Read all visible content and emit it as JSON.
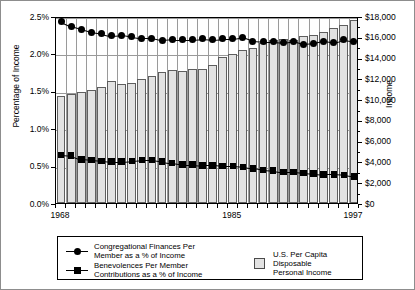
{
  "chart_data": {
    "type": "bar",
    "title": "",
    "subtitle": "",
    "xlabel": "",
    "ylabel": "Percentage of Income",
    "ylabel_right": "Income",
    "grid": true,
    "legend_position": "bottom",
    "x": [
      1968,
      1969,
      1970,
      1971,
      1972,
      1973,
      1974,
      1975,
      1976,
      1977,
      1978,
      1979,
      1980,
      1981,
      1982,
      1983,
      1984,
      1985,
      1986,
      1987,
      1988,
      1989,
      1990,
      1991,
      1992,
      1993,
      1994,
      1995,
      1996,
      1997
    ],
    "xtick_labels": [
      "1968",
      "1985",
      "1997"
    ],
    "xtick_values": [
      1968,
      1985,
      1997
    ],
    "ylim": [
      0.0,
      2.5
    ],
    "ytick_labels": [
      "0.0%",
      "0.5%",
      "1.0%",
      "1.5%",
      "2.0%",
      "2.5%"
    ],
    "ytick_values": [
      0.0,
      0.5,
      1.0,
      1.5,
      2.0,
      2.5
    ],
    "ylim_right": [
      0,
      18000
    ],
    "ytick_labels_right": [
      "$0",
      "$2,000",
      "$4,000",
      "$6,000",
      "$8,000",
      "$10,000",
      "$12,000",
      "$14,000",
      "$16,000",
      "$18,000"
    ],
    "ytick_values_right": [
      0,
      2000,
      4000,
      6000,
      8000,
      10000,
      12000,
      14000,
      16000,
      18000
    ],
    "series": [
      {
        "name": "U.S. Per Capita Disposable Personal Income",
        "type": "bar",
        "axis": "right",
        "unit": "USD",
        "color": "#e2e2e2",
        "edge_color": "#5e5e5e",
        "values": [
          10300,
          10500,
          10700,
          10900,
          11200,
          11700,
          11500,
          11600,
          11900,
          12200,
          12600,
          12800,
          12700,
          12900,
          12900,
          13300,
          14100,
          14350,
          14750,
          14900,
          15450,
          15700,
          15800,
          15700,
          16100,
          16200,
          16500,
          16850,
          17150,
          17650
        ]
      },
      {
        "name": "Congregational Finances Per Member as a % of Income",
        "type": "line",
        "axis": "left",
        "unit": "percent",
        "marker": "circle",
        "color": "#000000",
        "values": [
          2.45,
          2.39,
          2.35,
          2.31,
          2.29,
          2.26,
          2.27,
          2.25,
          2.23,
          2.23,
          2.2,
          2.21,
          2.21,
          2.21,
          2.22,
          2.21,
          2.22,
          2.22,
          2.24,
          2.19,
          2.18,
          2.18,
          2.17,
          2.19,
          2.15,
          2.16,
          2.19,
          2.17,
          2.21,
          2.19
        ]
      },
      {
        "name": "Benevolences Per Member Contributions as a % of Income",
        "type": "line",
        "axis": "left",
        "unit": "percent",
        "marker": "square",
        "color": "#000000",
        "values": [
          0.67,
          0.66,
          0.61,
          0.6,
          0.59,
          0.58,
          0.58,
          0.59,
          0.6,
          0.6,
          0.58,
          0.56,
          0.54,
          0.54,
          0.53,
          0.53,
          0.52,
          0.52,
          0.51,
          0.49,
          0.47,
          0.46,
          0.44,
          0.44,
          0.43,
          0.42,
          0.41,
          0.41,
          0.4,
          0.38
        ]
      }
    ],
    "annotations": []
  },
  "axes": {
    "left_title": "Percentage of Income",
    "right_title": "Income"
  },
  "legend": {
    "entries": [
      {
        "key": "line-circle",
        "label": "Congregational Finances Per\nMember  as a % of Income"
      },
      {
        "key": "line-square",
        "label": "Benevolences Per Member\nContributions as a % of Income"
      },
      {
        "key": "swatch",
        "label": "U.S. Per Capita Disposable\nPersonal Income"
      }
    ]
  }
}
